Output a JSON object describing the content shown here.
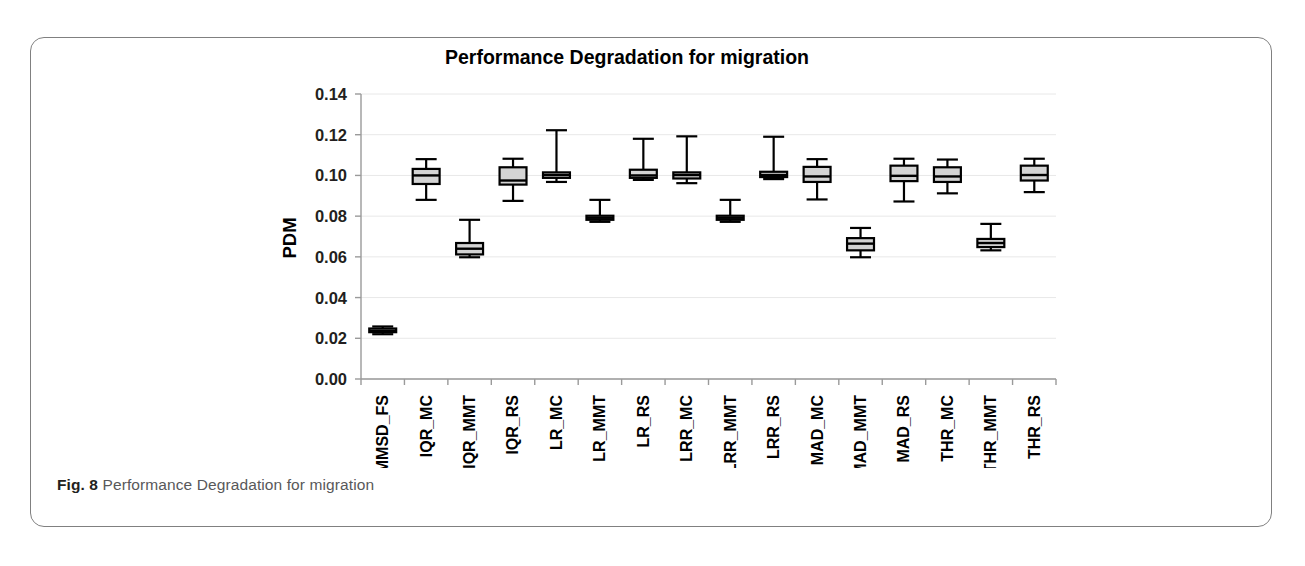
{
  "figure": {
    "caption_label": "Fig. 8",
    "caption_text": "Performance Degradation for migration"
  },
  "chart_data": {
    "type": "box",
    "title": "Performance Degradation for migration",
    "xlabel": "",
    "ylabel": "PDM",
    "ylim": [
      0.0,
      0.14
    ],
    "ytick_labels": [
      "0.00",
      "0.02",
      "0.04",
      "0.06",
      "0.08",
      "0.10",
      "0.12",
      "0.14"
    ],
    "ytick_values": [
      0.0,
      0.02,
      0.04,
      0.06,
      0.08,
      0.1,
      0.12,
      0.14
    ],
    "grid": true,
    "legend": "none",
    "box_fill_color": "#d4d4d4",
    "box_line_color": "#000000",
    "categories": [
      "MMSD_FS",
      "IQR_MC",
      "IQR_MMT",
      "IQR_RS",
      "LR_MC",
      "LR_MMT",
      "LR_RS",
      "LRR_MC",
      "LRR_MMT",
      "LRR_RS",
      "MAD_MC",
      "MAD_MMT",
      "MAD_RS",
      "THR_MC",
      "THR_MMT",
      "THR_RS"
    ],
    "boxes": [
      {
        "label": "MMSD_FS",
        "whisker_low": 0.022,
        "q1": 0.023,
        "median": 0.0237,
        "q3": 0.0248,
        "whisker_high": 0.0258
      },
      {
        "label": "IQR_MC",
        "whisker_low": 0.088,
        "q1": 0.0958,
        "median": 0.1,
        "q3": 0.1032,
        "whisker_high": 0.108
      },
      {
        "label": "IQR_MMT",
        "whisker_low": 0.0598,
        "q1": 0.0612,
        "median": 0.064,
        "q3": 0.0668,
        "whisker_high": 0.0782
      },
      {
        "label": "IQR_RS",
        "whisker_low": 0.0875,
        "q1": 0.0955,
        "median": 0.0975,
        "q3": 0.104,
        "whisker_high": 0.1082
      },
      {
        "label": "LR_MC",
        "whisker_low": 0.0968,
        "q1": 0.0988,
        "median": 0.1002,
        "q3": 0.1015,
        "whisker_high": 0.1222
      },
      {
        "label": "LR_MMT",
        "whisker_low": 0.0772,
        "q1": 0.0782,
        "median": 0.0792,
        "q3": 0.0802,
        "whisker_high": 0.088
      },
      {
        "label": "LR_RS",
        "whisker_low": 0.0978,
        "q1": 0.0988,
        "median": 0.1,
        "q3": 0.1028,
        "whisker_high": 0.118
      },
      {
        "label": "LRR_MC",
        "whisker_low": 0.0962,
        "q1": 0.0985,
        "median": 0.1002,
        "q3": 0.1015,
        "whisker_high": 0.1192
      },
      {
        "label": "LRR_MMT",
        "whisker_low": 0.0772,
        "q1": 0.0782,
        "median": 0.0792,
        "q3": 0.0802,
        "whisker_high": 0.088
      },
      {
        "label": "LRR_RS",
        "whisker_low": 0.0982,
        "q1": 0.0992,
        "median": 0.1002,
        "q3": 0.1018,
        "whisker_high": 0.119
      },
      {
        "label": "MAD_MC",
        "whisker_low": 0.0882,
        "q1": 0.0968,
        "median": 0.0995,
        "q3": 0.1042,
        "whisker_high": 0.108
      },
      {
        "label": "MAD_MMT",
        "whisker_low": 0.0598,
        "q1": 0.0632,
        "median": 0.0665,
        "q3": 0.0692,
        "whisker_high": 0.0742
      },
      {
        "label": "MAD_RS",
        "whisker_low": 0.0872,
        "q1": 0.0972,
        "median": 0.0998,
        "q3": 0.1048,
        "whisker_high": 0.1082
      },
      {
        "label": "THR_MC",
        "whisker_low": 0.0912,
        "q1": 0.0968,
        "median": 0.0995,
        "q3": 0.104,
        "whisker_high": 0.1078
      },
      {
        "label": "THR_MMT",
        "whisker_low": 0.0632,
        "q1": 0.0648,
        "median": 0.0668,
        "q3": 0.0688,
        "whisker_high": 0.0762
      },
      {
        "label": "THR_RS",
        "whisker_low": 0.0918,
        "q1": 0.0975,
        "median": 0.1002,
        "q3": 0.1048,
        "whisker_high": 0.1082
      }
    ]
  }
}
